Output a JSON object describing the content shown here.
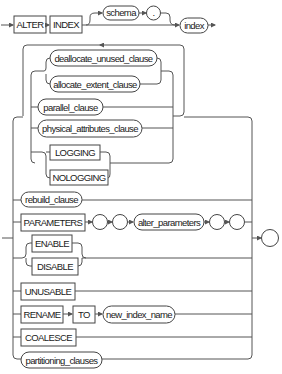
{
  "diagram": {
    "keywords": {
      "alter": "ALTER",
      "index": "INDEX",
      "logging": "LOGGING",
      "nologging": "NOLOGGING",
      "parameters": "PARAMETERS",
      "enable": "ENABLE",
      "disable": "DISABLE",
      "unusable": "UNUSABLE",
      "rename": "RENAME",
      "to": "TO",
      "coalesce": "COALESCE"
    },
    "nonterminals": {
      "schema": "schema",
      "index_name": "index",
      "deallocate": "deallocate_unused_clause",
      "allocate": "allocate_extent_clause",
      "parallel": "parallel_clause",
      "physical": "physical_attributes_clause",
      "rebuild": "rebuild_clause",
      "alter_parameters": "alter_parameters",
      "new_index_name": "new_index_name",
      "partitioning": "partitioning_clauses"
    },
    "punctuation": {
      "dot": ".",
      "paren_open_1": "",
      "paren_open_2": "",
      "paren_close_1": "",
      "paren_close_2": "",
      "terminator": ""
    }
  }
}
